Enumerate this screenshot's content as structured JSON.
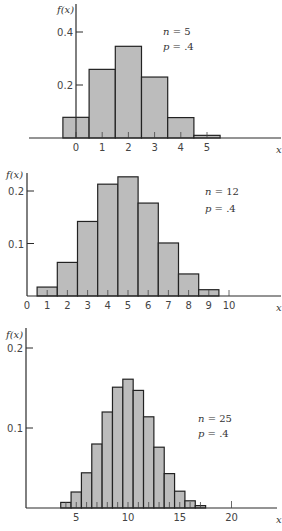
{
  "chart_data": [
    {
      "type": "bar",
      "title": "",
      "xlabel": "x",
      "ylabel": "f(x)",
      "annotation": [
        "n = 5",
        "p = .4"
      ],
      "categories": [
        0,
        1,
        2,
        3,
        4,
        5
      ],
      "values": [
        0.078,
        0.259,
        0.346,
        0.23,
        0.077,
        0.01
      ],
      "x_tick_labels": [
        "0",
        "1",
        "2",
        "3",
        "4",
        "5"
      ],
      "y_tick_labels": [
        "0.2",
        "0.4"
      ],
      "y_ticks": [
        0.2,
        0.4
      ],
      "ylim": [
        0,
        0.46
      ],
      "grid": false,
      "layout": {
        "top": 0,
        "height": 160,
        "axis_x": 76,
        "baseline_y": 138,
        "unit_x": 26.2,
        "px_per_y": 265,
        "x0_px": 76,
        "axis_top": 4,
        "line_left": 29,
        "line_right": 281
      }
    },
    {
      "type": "bar",
      "title": "",
      "xlabel": "x",
      "ylabel": "f(x)",
      "annotation": [
        "n = 12",
        "p = .4"
      ],
      "categories": [
        1,
        2,
        3,
        4,
        5,
        6,
        7,
        8,
        9
      ],
      "values": [
        0.017,
        0.064,
        0.142,
        0.213,
        0.227,
        0.177,
        0.101,
        0.042,
        0.012
      ],
      "x_tick_labels": [
        "0",
        "1",
        "2",
        "3",
        "4",
        "5",
        "6",
        "7",
        "8",
        "9",
        "10"
      ],
      "y_tick_labels": [
        "0.1",
        "0.2"
      ],
      "y_ticks": [
        0.1,
        0.2
      ],
      "ylim": [
        0,
        0.245
      ],
      "grid": false,
      "layout": {
        "top": 160,
        "height": 160,
        "axis_x": 27,
        "baseline_y": 136,
        "unit_x": 20.2,
        "px_per_y": 525,
        "x0_px": 27,
        "axis_top": 13,
        "line_left": 27,
        "line_right": 281
      }
    },
    {
      "type": "bar",
      "title": "",
      "xlabel": "x",
      "ylabel": "f(x)",
      "annotation": [
        "n = 25",
        "p = .4"
      ],
      "categories": [
        4,
        5,
        6,
        7,
        8,
        9,
        10,
        11,
        12,
        13,
        14,
        15,
        16,
        17
      ],
      "values": [
        0.007,
        0.02,
        0.044,
        0.08,
        0.12,
        0.151,
        0.161,
        0.147,
        0.114,
        0.076,
        0.043,
        0.021,
        0.009,
        0.003
      ],
      "x_tick_labels": [
        "5",
        "10",
        "15",
        "20"
      ],
      "x_tick_values": [
        5,
        10,
        15,
        20
      ],
      "y_tick_labels": [
        "0.1",
        "0.2"
      ],
      "y_ticks": [
        0.1,
        0.2
      ],
      "ylim": [
        0,
        0.23
      ],
      "grid": false,
      "layout": {
        "top": 320,
        "height": 211,
        "axis_x": 26,
        "baseline_y": 188,
        "unit_x": 10.35,
        "px_per_y": 800,
        "x0_px": 24.5,
        "axis_top": 8,
        "line_left": 26,
        "line_right": 277
      }
    }
  ]
}
